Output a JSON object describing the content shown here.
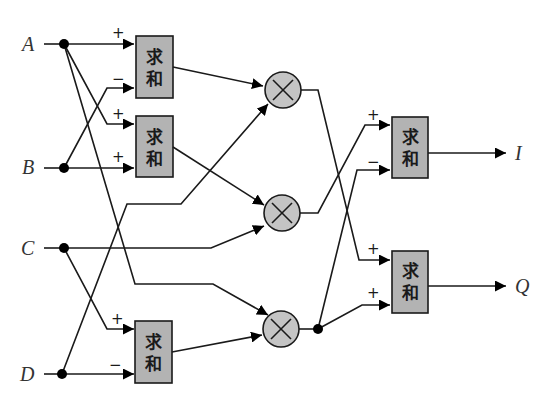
{
  "diagram": {
    "inputs": [
      {
        "id": "A",
        "label": "A"
      },
      {
        "id": "B",
        "label": "B"
      },
      {
        "id": "C",
        "label": "C"
      },
      {
        "id": "D",
        "label": "D"
      }
    ],
    "outputs": [
      {
        "id": "I",
        "label": "I"
      },
      {
        "id": "Q",
        "label": "Q"
      }
    ],
    "summers": [
      {
        "id": "sum1",
        "line1": "求",
        "line2": "和",
        "signs": [
          "+",
          "−"
        ]
      },
      {
        "id": "sum2",
        "line1": "求",
        "line2": "和",
        "signs": [
          "+",
          "+"
        ]
      },
      {
        "id": "sum3",
        "line1": "求",
        "line2": "和",
        "signs": [
          "+",
          "−"
        ]
      },
      {
        "id": "sum4",
        "line1": "求",
        "line2": "和",
        "signs": [
          "+",
          "−"
        ]
      },
      {
        "id": "sum5",
        "line1": "求",
        "line2": "和",
        "signs": [
          "+",
          "+"
        ]
      }
    ],
    "multipliers": [
      {
        "id": "mul1",
        "symbol": "×"
      },
      {
        "id": "mul2",
        "symbol": "×"
      },
      {
        "id": "mul3",
        "symbol": "×"
      }
    ],
    "colors": {
      "block_fill": "#b3b3b3",
      "multiplier_fill": "#c4c4c4",
      "line": "#1a1a1a"
    }
  }
}
